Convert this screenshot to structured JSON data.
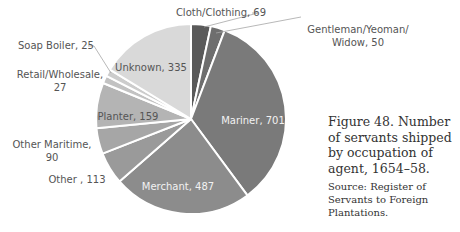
{
  "chart_data": {
    "type": "pie",
    "title": "",
    "start_angle_deg": 0,
    "direction": "clockwise",
    "categories": [
      "Cloth/Clothing",
      "Gentleman/Yeoman/Widow",
      "Mariner",
      "Merchant",
      "Other",
      "Other Maritime",
      "Planter",
      "Retail/Wholesale",
      "Soap Boiler",
      "Unknown"
    ],
    "values": [
      69,
      50,
      701,
      487,
      113,
      90,
      159,
      27,
      25,
      335
    ],
    "colors": [
      "#5a5a5a",
      "#6e6e6e",
      "#7a7a7a",
      "#8c8c8c",
      "#9a9a9a",
      "#a6a6a6",
      "#b4b4b4",
      "#c2c2c2",
      "#cccccc",
      "#d9d9d9"
    ],
    "labels": [
      {
        "text": "Cloth/Clothing, 69",
        "lines": [
          "Cloth/Clothing, 69"
        ],
        "x": 221,
        "y": 16,
        "anchor": "middle",
        "color": "#555",
        "leader": [
          [
            252,
            13
          ],
          [
            258,
            13
          ],
          [
            204,
            27
          ]
        ]
      },
      {
        "text": "Gentleman/Yeoman/ Widow, 50",
        "lines": [
          "Gentleman/Yeoman/",
          "Widow, 50"
        ],
        "x": 358,
        "y": 33,
        "anchor": "middle",
        "color": "#555",
        "leader": [
          [
            301,
            17
          ],
          [
            216,
            33
          ]
        ]
      },
      {
        "text": "Mariner, 701",
        "lines": [
          "Mariner, 701"
        ],
        "x": 253,
        "y": 124,
        "anchor": "middle",
        "color": "#f2f2f2"
      },
      {
        "text": "Merchant, 487",
        "lines": [
          "Merchant, 487"
        ],
        "x": 178,
        "y": 190,
        "anchor": "middle",
        "color": "#f2f2f2"
      },
      {
        "text": "Other , 113",
        "lines": [
          "Other  , 113"
        ],
        "x": 77,
        "y": 183,
        "anchor": "middle",
        "color": "#555"
      },
      {
        "text": "Other Maritime, 90",
        "lines": [
          "Other Maritime,",
          "90"
        ],
        "x": 52,
        "y": 148,
        "anchor": "middle",
        "color": "#555"
      },
      {
        "text": "Planter, 159",
        "lines": [
          "Planter, 159"
        ],
        "x": 128,
        "y": 120,
        "anchor": "middle",
        "color": "#555"
      },
      {
        "text": "Retail/Wholesale, 27",
        "lines": [
          "Retail/Wholesale,",
          "27"
        ],
        "x": 60,
        "y": 78,
        "anchor": "middle",
        "color": "#555"
      },
      {
        "text": "Soap Boiler, 25",
        "lines": [
          "Soap Boiler, 25"
        ],
        "x": 56,
        "y": 49,
        "anchor": "middle",
        "color": "#555",
        "leader": [
          [
            88,
            46
          ],
          [
            94,
            46
          ],
          [
            111,
            73
          ]
        ]
      },
      {
        "text": "Unknown, 335",
        "lines": [
          "Unknown, 335"
        ],
        "x": 151,
        "y": 71,
        "anchor": "middle",
        "color": "#555"
      }
    ],
    "geometry": {
      "cx": 191,
      "cy": 119,
      "r": 95
    },
    "legend": "none"
  },
  "caption": {
    "figure": "Figure 48. Number of servants shipped by occupation of agent, 1654–58.",
    "source": "Source: Register of Servants to Foreign Plantations."
  }
}
